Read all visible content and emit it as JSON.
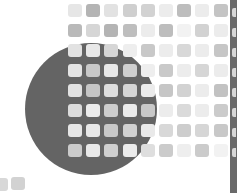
{
  "graphic": {
    "description": "Abstract decorative pattern: dark grey circle overlaid with grid of rounded grey squares, dark vertical strip at right edge",
    "background": "#ffffff",
    "circle": {
      "cx": 91,
      "cy": 109,
      "r": 66,
      "color": "#646464"
    },
    "grid": {
      "origin_x": 68,
      "origin_y": 4,
      "step_x": 18.2,
      "step_y": 20,
      "tile_w": 14,
      "tile_h": 13,
      "rows": [
        [
          "#e6e6e6",
          "#b4b4b4",
          "#e2e2e2",
          "#cfcfcf",
          "#d2d2d2",
          "#ececec",
          "#bdbdbd",
          "#ececec",
          "#c4c4c4"
        ],
        [
          "#b9b9b9",
          "#d6d6d6",
          "#b4b4b4",
          "#bebebe",
          "#ececec",
          "#bdbdbd",
          "#f2f2f2",
          "#d2d2d2",
          "#ececec"
        ],
        [
          "#e2e2e2",
          "#e8e8e8",
          "#d6d6d6",
          "#eeeeee",
          "#c8c8c8",
          "#ececec",
          "#d8d8d8",
          "#ececec",
          "#c6c6c6"
        ],
        [
          "#e4e4e4",
          "#c8c8c8",
          "#e8e8e8",
          "#cfcfcf",
          "#eeeeee",
          "#c9c9c9",
          "#ececec",
          "#d6d6d6",
          "#ececec"
        ],
        [
          "#e2e2e2",
          "#c6c6c6",
          "#dedede",
          "#d6d6d6",
          "#ebebeb",
          "#c6c6c6",
          "#d2d2d2",
          "#ececec",
          "#c2c2c2"
        ],
        [
          "#dcdcdc",
          "#ececec",
          "#cdcdcd",
          "#ebebeb",
          "#c8c8c8",
          "#ececec",
          "#dadada",
          "#ececec",
          "#cbcbcb"
        ],
        [
          "#e6e6e6",
          "#e8e8e8",
          "#c8c8c8",
          "#d2d2d2",
          "#e9e9e9",
          "#d8d8d8",
          "#cdcdcd",
          "#d6d6d6",
          "#c8c8c8"
        ],
        [
          "#cbcbcb",
          "#e9e9e9",
          "#cfcfcf",
          "#ececec",
          "#dedede",
          "#cbcbcb",
          "#eeeeee",
          "#cbcbcb",
          "#f2f2f2"
        ]
      ]
    },
    "extra_tiles": [
      {
        "x": -6,
        "y": 178,
        "color": "#d8d8d8"
      },
      {
        "x": 11,
        "y": 177,
        "color": "#d2d2d2"
      }
    ],
    "strip": {
      "x": 230,
      "width": 7,
      "color": "#6a6a6a",
      "notch_color": "#d8d8d8",
      "notch_x": 232,
      "notch_ys": [
        8,
        28,
        48,
        68,
        88,
        108,
        128,
        148
      ]
    }
  }
}
